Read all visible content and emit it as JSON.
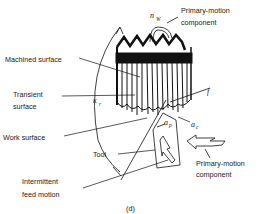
{
  "diagram": {
    "caption": "(d)",
    "labels": {
      "primary_motion_top_line1": "Primary-motion",
      "primary_motion_top_line2": "component",
      "machined_surface": "Machined surface",
      "transient_surface_line1": "Transient",
      "transient_surface_line2": "surface",
      "work_surface": "Work surface",
      "tool": "Tool",
      "intermittent_feed_line1": "Intermittent",
      "intermittent_feed_line2": "feed motion",
      "primary_motion_right_line1": "Primary-motion",
      "primary_motion_right_line2": "component"
    },
    "symbols": {
      "n": "n",
      "n_sub": "W",
      "kappa": "κ",
      "kappa_sub": "r",
      "f": "f",
      "a_p": "a",
      "a_p_sub": "p",
      "a_c": "a",
      "a_c_sub": "c"
    }
  }
}
